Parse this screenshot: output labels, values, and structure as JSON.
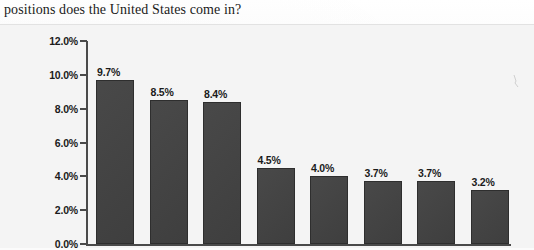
{
  "page": {
    "question_text": "positions does the United States come in?",
    "background_color": "#f4f4f4",
    "bar_color": "#424242",
    "axis_color": "#4a4a4a",
    "text_color": "#1b1b1b"
  },
  "chart_data": {
    "type": "bar",
    "title": "",
    "subtitle": "",
    "xlabel": "",
    "ylabel": "",
    "categories": [
      "",
      "",
      "",
      "",
      "",
      "",
      "",
      ""
    ],
    "values": [
      9.7,
      8.5,
      8.4,
      4.5,
      4.0,
      3.7,
      3.7,
      3.2
    ],
    "data_labels": [
      "9.7%",
      "8.5%",
      "8.4%",
      "4.5%",
      "4.0%",
      "3.7%",
      "3.7%",
      "3.2%"
    ],
    "ylim": [
      0,
      12
    ],
    "ytick_values": [
      0,
      2,
      4,
      6,
      8,
      10,
      12
    ],
    "ytick_labels": [
      "0.0%",
      "2.0%",
      "4.0%",
      "6.0%",
      "8.0%",
      "10.0%",
      "12.0%"
    ],
    "grid": false,
    "legend": false,
    "legend_position": "none",
    "series": [
      {
        "name": "Share",
        "values": [
          9.7,
          8.5,
          8.4,
          4.5,
          4.0,
          3.7,
          3.7,
          3.2
        ]
      }
    ]
  }
}
